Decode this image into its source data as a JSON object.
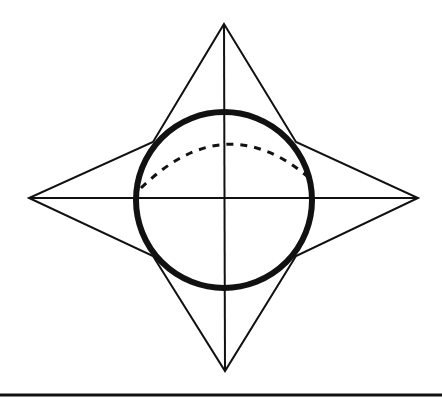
{
  "diagram": {
    "title": "",
    "colors": {
      "background": "#ffffff",
      "stroke": "#111111"
    },
    "star": {
      "points": [
        [
          224,
          24
        ],
        [
          296,
          142
        ],
        [
          418,
          198
        ],
        [
          296,
          256
        ],
        [
          225,
          371
        ],
        [
          153,
          256
        ],
        [
          29,
          198
        ],
        [
          153,
          142
        ]
      ],
      "stroke_width": 2
    },
    "circle": {
      "cx": 224,
      "cy": 200,
      "r": 88,
      "stroke_width": 6
    },
    "axes": {
      "vertical": {
        "x1": 224,
        "y1": 24,
        "x2": 225,
        "y2": 371
      },
      "horizontal": {
        "x1": 29,
        "y1": 198,
        "x2": 418,
        "y2": 198
      },
      "stroke_width": 2
    },
    "dashed_arc": {
      "path": "M 141 188 Q 224 107 307 176",
      "dash": "7 7",
      "stroke_width": 3
    },
    "baseline": {
      "x1": 0,
      "y1": 395,
      "x2": 442,
      "y2": 395,
      "stroke_width": 3
    }
  }
}
